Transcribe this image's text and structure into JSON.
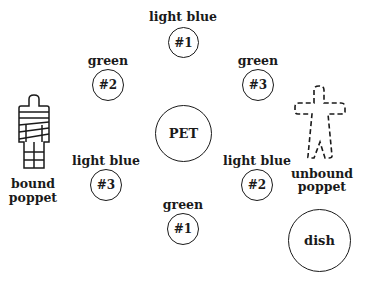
{
  "diagram": {
    "type": "layout",
    "nodes": [
      {
        "id": "lb1",
        "color_label": "light blue",
        "number": "#1"
      },
      {
        "id": "g2",
        "color_label": "green",
        "number": "#2"
      },
      {
        "id": "g3",
        "color_label": "green",
        "number": "#3"
      },
      {
        "id": "lb3",
        "color_label": "light blue",
        "number": "#3"
      },
      {
        "id": "lb2",
        "color_label": "light blue",
        "number": "#2"
      },
      {
        "id": "g1",
        "color_label": "green",
        "number": "#1"
      }
    ],
    "center": {
      "label": "PET"
    },
    "dish": {
      "label": "dish"
    },
    "bound_poppet": {
      "line1": "bound",
      "line2": "poppet"
    },
    "unbound_poppet": {
      "line1": "unbound",
      "line2": "poppet"
    },
    "stroke_color": "#1a1a1a",
    "background": "#ffffff"
  }
}
